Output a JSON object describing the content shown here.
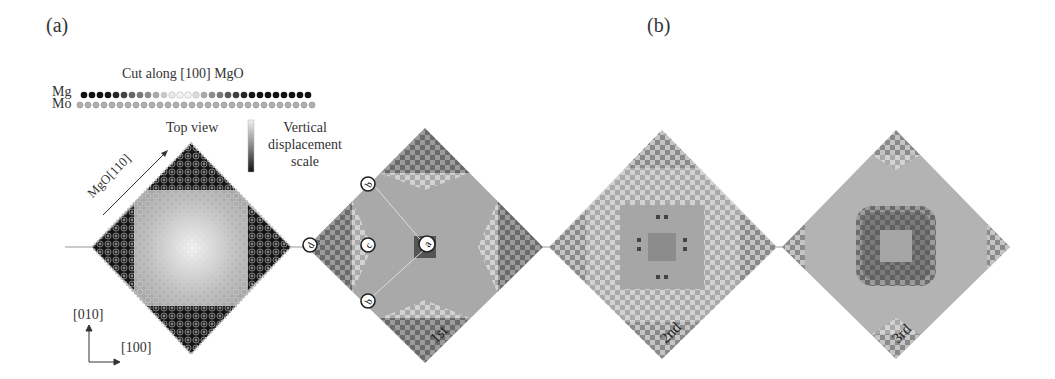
{
  "figure": {
    "panel_a": {
      "label": "(a)",
      "cut_title": "Cut along [100] MgO",
      "row_labels": {
        "top": "Mg",
        "bottom": "Mo"
      },
      "top_view_label": "Top view",
      "direction_label": "MgO[110]",
      "scale_label": [
        "Vertical",
        "displacement",
        "scale"
      ],
      "axes": {
        "vertical": "[010]",
        "horizontal": "[100]"
      }
    },
    "panel_b": {
      "label": "(b)",
      "modes": [
        {
          "name": "1st",
          "markers": [
            "a",
            "b",
            "b",
            "c",
            "d"
          ]
        },
        {
          "name": "2nd"
        },
        {
          "name": "3rd"
        }
      ]
    },
    "colors": {
      "dark": "#1a1a1a",
      "mid": "#7a7a7a",
      "light": "#bdbdbd",
      "pale": "#e8e8e8"
    }
  }
}
